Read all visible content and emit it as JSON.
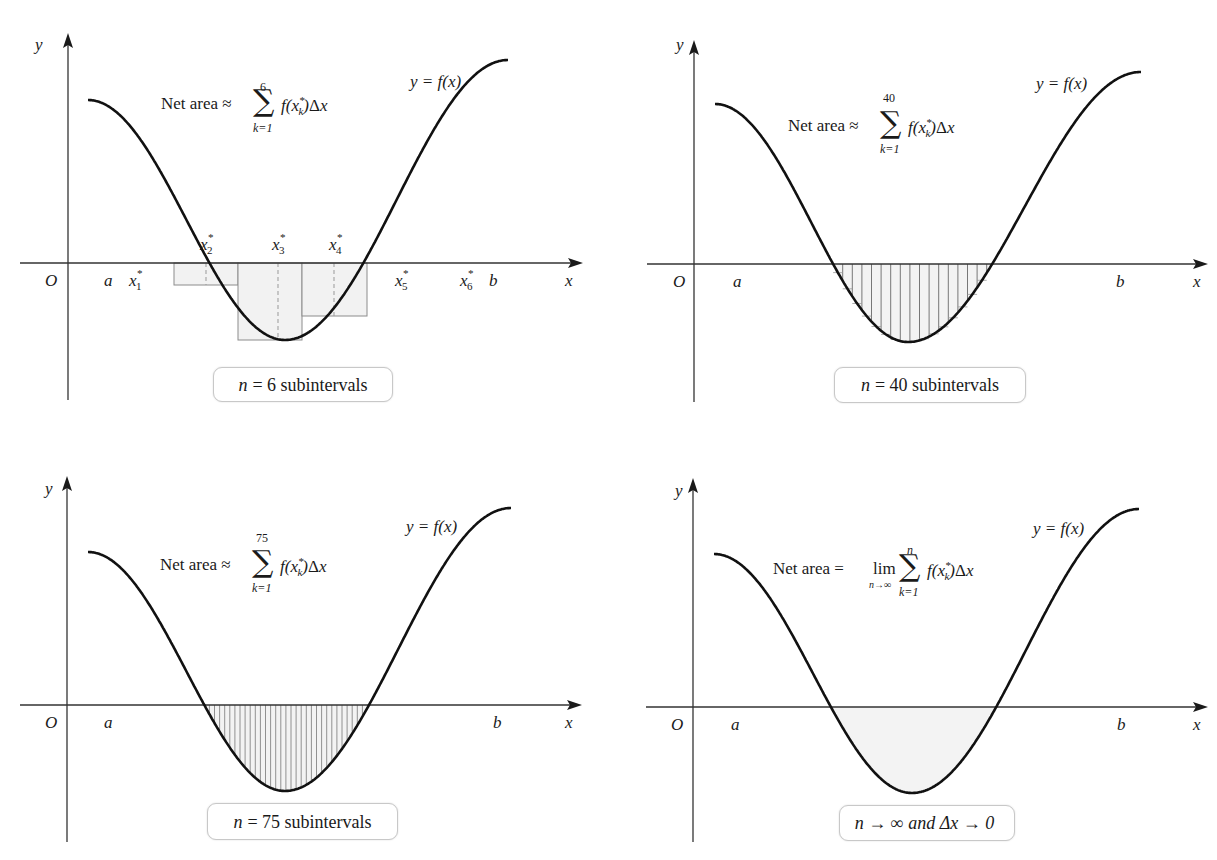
{
  "figure": {
    "panels": [
      {
        "id": "n6",
        "origin_label": "O",
        "x_axis_label": "x",
        "y_axis_label": "y",
        "a_label": "a",
        "b_label": "b",
        "curve_label": "y = f(x)",
        "formula": {
          "lhs": "Net area ≈",
          "sum_upper": "6",
          "sum_lower": "k=1",
          "summand": "f(x*k)Δx"
        },
        "sample_point_labels": [
          "x*1",
          "x*2",
          "x*3",
          "x*4",
          "x*5",
          "x*6"
        ],
        "caption": {
          "var": "n",
          "text": "= 6 subintervals"
        },
        "n": 6
      },
      {
        "id": "n40",
        "origin_label": "O",
        "x_axis_label": "x",
        "y_axis_label": "y",
        "a_label": "a",
        "b_label": "b",
        "curve_label": "y = f(x)",
        "formula": {
          "lhs": "Net area ≈",
          "sum_upper": "40",
          "sum_lower": "k=1",
          "summand": "f(x*k)Δx"
        },
        "caption": {
          "var": "n",
          "text": "= 40 subintervals"
        },
        "n": 40
      },
      {
        "id": "n75",
        "origin_label": "O",
        "x_axis_label": "x",
        "y_axis_label": "y",
        "a_label": "a",
        "b_label": "b",
        "curve_label": "y = f(x)",
        "formula": {
          "lhs": "Net area ≈",
          "sum_upper": "75",
          "sum_lower": "k=1",
          "summand": "f(x*k)Δx"
        },
        "caption": {
          "var": "n",
          "text": "= 75 subintervals"
        },
        "n": 75
      },
      {
        "id": "limit",
        "origin_label": "O",
        "x_axis_label": "x",
        "y_axis_label": "y",
        "a_label": "a",
        "b_label": "b",
        "curve_label": "y = f(x)",
        "formula": {
          "lhs": "Net area =",
          "lim": "lim",
          "lim_sub": "n→∞",
          "sum_upper": "n",
          "sum_lower": "k=1",
          "summand": "f(x*k)Δx"
        },
        "caption": {
          "var": "",
          "text": "n → ∞ and Δx → 0"
        },
        "n": "∞"
      }
    ]
  },
  "chart_data": {
    "type": "area",
    "xlabel": "x",
    "ylabel": "y",
    "panels": [
      {
        "n": 6,
        "method": "midpoint rectangles (shown only where f < 0)",
        "formula": "Net area ≈ Σ_{k=1}^{6} f(x_k*)Δx"
      },
      {
        "n": 40,
        "method": "rectangles under negative region",
        "formula": "Net area ≈ Σ_{k=1}^{40} f(x_k*)Δx"
      },
      {
        "n": 75,
        "method": "rectangles under negative region",
        "formula": "Net area ≈ Σ_{k=1}^{75} f(x_k*)Δx"
      },
      {
        "n": "∞",
        "method": "limit (shaded region)",
        "formula": "Net area = lim_{n→∞} Σ_{k=1}^{n} f(x_k*)Δx"
      }
    ],
    "legend": [],
    "grid": false
  },
  "style": {
    "ink": "#1a1a1a",
    "rect_stroke": "#8c8c8c",
    "rect_fill": "#f2f2f2",
    "shade_fill": "#f3f3f3",
    "caption_border": "#c8c8c8"
  }
}
